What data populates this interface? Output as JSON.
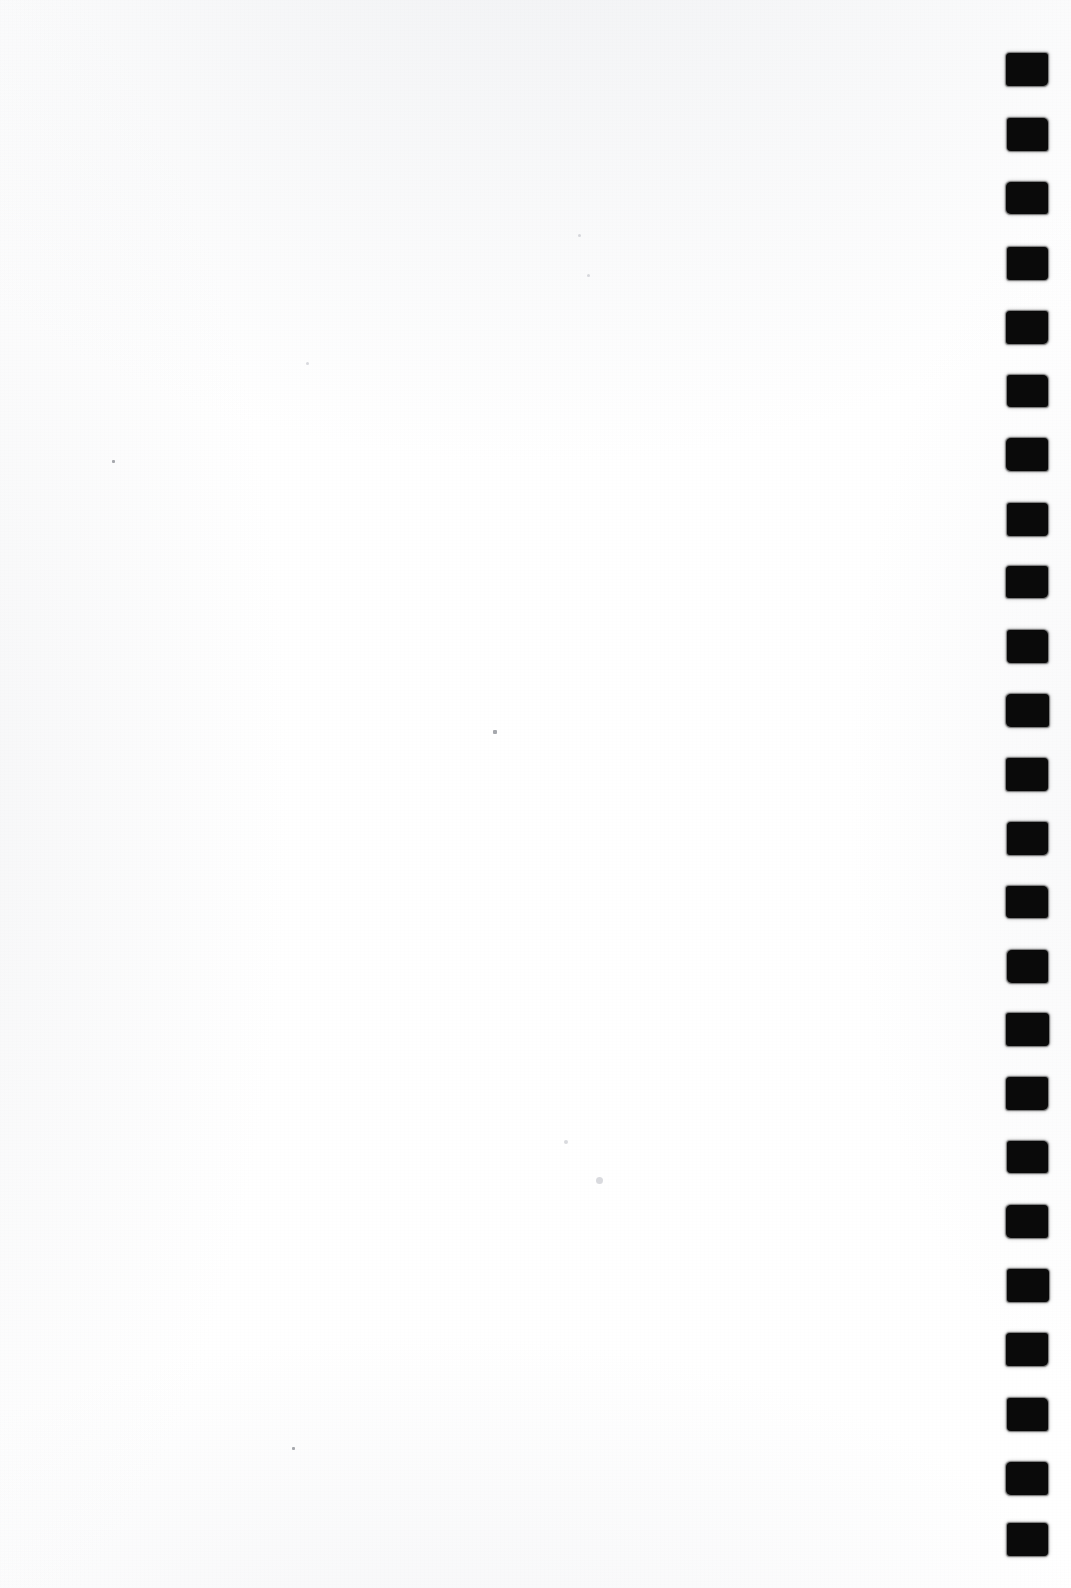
{
  "document": {
    "kind": "scanned-page",
    "page_label": "",
    "content_text": "",
    "orientation": "portrait",
    "width_px": 1071,
    "height_px": 1588,
    "background_color": "#ffffff",
    "ink_color": "#0a0a0a",
    "description": "Blank scanned sheet with a vertical column of solid black square binding / punch marks along the right edge"
  },
  "punch_marks": {
    "name": "right-edge-binding-marks",
    "count": 24,
    "shape": "square",
    "color": "#0a0a0a",
    "left_px": 1006,
    "width_px": 42,
    "height_px": 33,
    "first_top_px": 53,
    "pitch_px": 64.5,
    "items": [
      {
        "index": 1,
        "top": 53,
        "left": 1006,
        "w": 42,
        "h": 33
      },
      {
        "index": 2,
        "top": 118,
        "left": 1007,
        "w": 41,
        "h": 33
      },
      {
        "index": 3,
        "top": 182,
        "left": 1006,
        "w": 42,
        "h": 32
      },
      {
        "index": 4,
        "top": 247,
        "left": 1007,
        "w": 41,
        "h": 33
      },
      {
        "index": 5,
        "top": 311,
        "left": 1006,
        "w": 42,
        "h": 33
      },
      {
        "index": 6,
        "top": 375,
        "left": 1007,
        "w": 41,
        "h": 32
      },
      {
        "index": 7,
        "top": 438,
        "left": 1006,
        "w": 42,
        "h": 33
      },
      {
        "index": 8,
        "top": 503,
        "left": 1007,
        "w": 41,
        "h": 33
      },
      {
        "index": 9,
        "top": 566,
        "left": 1006,
        "w": 42,
        "h": 32
      },
      {
        "index": 10,
        "top": 630,
        "left": 1007,
        "w": 41,
        "h": 33
      },
      {
        "index": 11,
        "top": 694,
        "left": 1006,
        "w": 43,
        "h": 33
      },
      {
        "index": 12,
        "top": 758,
        "left": 1006,
        "w": 42,
        "h": 33
      },
      {
        "index": 13,
        "top": 822,
        "left": 1007,
        "w": 41,
        "h": 33
      },
      {
        "index": 14,
        "top": 886,
        "left": 1006,
        "w": 42,
        "h": 32
      },
      {
        "index": 15,
        "top": 950,
        "left": 1007,
        "w": 41,
        "h": 33
      },
      {
        "index": 16,
        "top": 1013,
        "left": 1006,
        "w": 43,
        "h": 33
      },
      {
        "index": 17,
        "top": 1077,
        "left": 1006,
        "w": 42,
        "h": 33
      },
      {
        "index": 18,
        "top": 1141,
        "left": 1007,
        "w": 41,
        "h": 32
      },
      {
        "index": 19,
        "top": 1205,
        "left": 1006,
        "w": 42,
        "h": 33
      },
      {
        "index": 20,
        "top": 1269,
        "left": 1007,
        "w": 42,
        "h": 33
      },
      {
        "index": 21,
        "top": 1333,
        "left": 1006,
        "w": 42,
        "h": 33
      },
      {
        "index": 22,
        "top": 1398,
        "left": 1007,
        "w": 41,
        "h": 33
      },
      {
        "index": 23,
        "top": 1462,
        "left": 1006,
        "w": 42,
        "h": 33
      },
      {
        "index": 24,
        "top": 1523,
        "left": 1007,
        "w": 41,
        "h": 33
      }
    ]
  },
  "specks": {
    "name": "scan-dust-specks",
    "items": [
      {
        "left": 112,
        "top": 460,
        "size": 3,
        "style": "square"
      },
      {
        "left": 493,
        "top": 730,
        "size": 3.5,
        "style": "square"
      },
      {
        "left": 292,
        "top": 1447,
        "size": 3,
        "style": "square"
      },
      {
        "left": 596,
        "top": 1177,
        "size": 7,
        "style": "faint"
      },
      {
        "left": 564,
        "top": 1140,
        "size": 4,
        "style": "faint"
      },
      {
        "left": 578,
        "top": 234,
        "size": 3,
        "style": "faint"
      },
      {
        "left": 587,
        "top": 274,
        "size": 3,
        "style": "faint"
      },
      {
        "left": 306,
        "top": 362,
        "size": 3,
        "style": "faint"
      },
      {
        "left": 39,
        "top": 1618,
        "size": 3,
        "style": "faint"
      }
    ]
  }
}
